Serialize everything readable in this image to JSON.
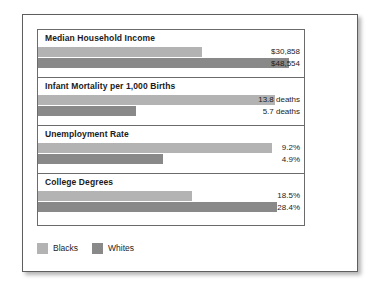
{
  "legend": {
    "entries": [
      {
        "label": "Blacks",
        "color": "#b3b3b3",
        "swatch_name": "legend-swatch-blacks"
      },
      {
        "label": "Whites",
        "color": "#898989",
        "swatch_name": "legend-swatch-whites"
      }
    ]
  },
  "chart_data": {
    "type": "bar",
    "orientation": "horizontal",
    "title": "",
    "xlabel": "",
    "ylabel": "",
    "grid": false,
    "legend_position": "bottom-left",
    "series_names": [
      "Blacks",
      "Whites"
    ],
    "series_colors": [
      "#b3b3b3",
      "#898989"
    ],
    "panels": [
      {
        "category": "Median Household Income",
        "values": [
          30858,
          48554
        ],
        "value_labels": [
          "$30,858",
          "$48,554"
        ],
        "bar_pct": [
          61.5,
          94.5
        ]
      },
      {
        "category": "Infant Mortality per 1,000 Births",
        "values": [
          13.8,
          5.7
        ],
        "value_labels": [
          "13.8 deaths",
          "5.7 deaths"
        ],
        "bar_pct": [
          89.0,
          36.8
        ]
      },
      {
        "category": "Unemployment Rate",
        "values": [
          9.2,
          4.9
        ],
        "value_labels": [
          "9.2%",
          "4.9%"
        ],
        "bar_pct": [
          88.0,
          47.0
        ]
      },
      {
        "category": "College Degrees",
        "values": [
          18.5,
          28.4
        ],
        "value_labels": [
          "18.5%",
          "28.4%"
        ],
        "bar_pct": [
          58.0,
          90.0
        ]
      }
    ]
  }
}
